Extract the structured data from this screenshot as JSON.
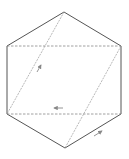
{
  "diagram": {
    "type": "hexagon-with-diagonals",
    "colors": {
      "edge": "#555555",
      "dashed": "#888888",
      "diagonal": "#999999",
      "arrow": "#888888",
      "background": "#ffffff"
    },
    "vertices": {
      "top": [
        64,
        12
      ],
      "upper_left": [
        7,
        46
      ],
      "upper_right": [
        121,
        46
      ],
      "lower_left": [
        7,
        114
      ],
      "lower_right": [
        121,
        114
      ],
      "bottom": [
        65,
        148
      ]
    },
    "solid_edges": [
      [
        "top",
        "upper_left"
      ],
      [
        "top",
        "upper_right"
      ],
      [
        "upper_left",
        "lower_left"
      ],
      [
        "upper_right",
        "lower_right"
      ],
      [
        "lower_left",
        "bottom"
      ],
      [
        "lower_right",
        "bottom"
      ]
    ],
    "dashed_edges": [
      [
        "upper_left",
        "upper_right"
      ],
      [
        "lower_left",
        "lower_right"
      ]
    ],
    "diagonals": [
      [
        "top",
        "lower_left"
      ],
      [
        "upper_right",
        "bottom"
      ]
    ],
    "arrows": [
      {
        "name": "arrow-up-right-left-diagonal",
        "from": [
          37,
          72
        ],
        "to": [
          41,
          65
        ]
      },
      {
        "name": "arrow-left-bottom-dashed",
        "from": [
          63,
          108
        ],
        "to": [
          54,
          108
        ]
      },
      {
        "name": "arrow-up-right-bottom-edge",
        "from": [
          94,
          136
        ],
        "to": [
          102,
          131
        ]
      }
    ]
  }
}
